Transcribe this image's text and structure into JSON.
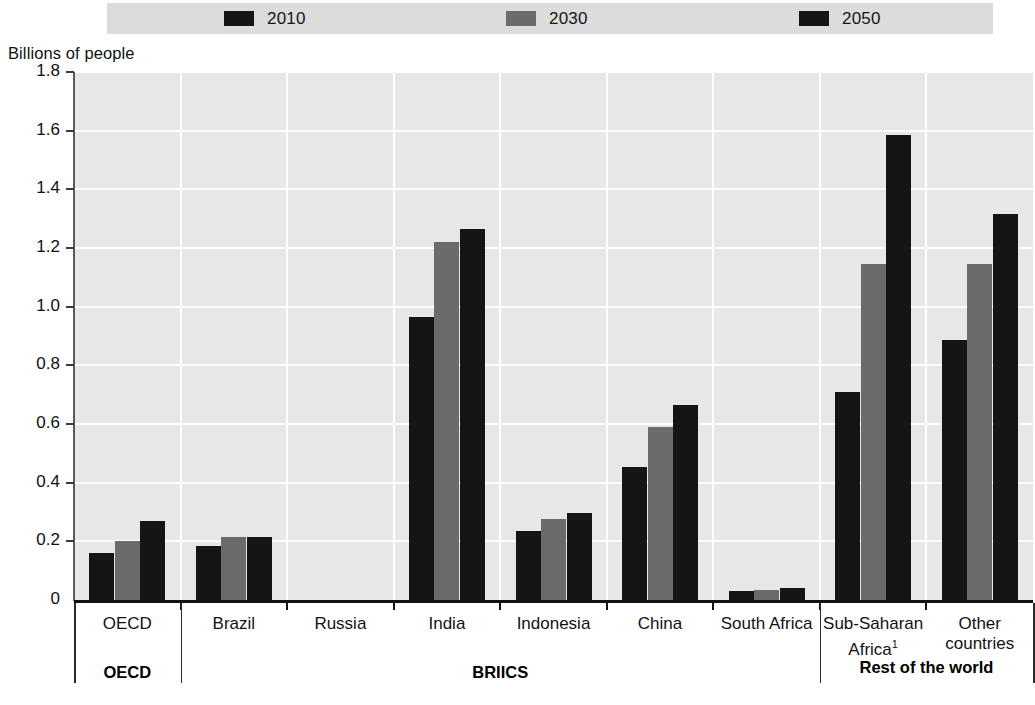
{
  "y_axis_title": "Billions of people",
  "legend": {
    "items": [
      {
        "label": "2010",
        "color": "#151515"
      },
      {
        "label": "2030",
        "color": "#6b6b6b"
      },
      {
        "label": "2050",
        "color": "#151515"
      }
    ]
  },
  "footnote": "",
  "group_labels": [
    {
      "label": "OECD"
    },
    {
      "label": "BRIICS"
    },
    {
      "label": "Rest of the world"
    }
  ],
  "y_ticks": [
    "1.8",
    "1.6",
    "1.4",
    "1.2",
    "1.0",
    "0.8",
    "0.6",
    "0.4",
    "0.2",
    "0"
  ],
  "chart_data": {
    "type": "bar",
    "title": "",
    "xlabel": "",
    "ylabel": "Billions of people",
    "ylim": [
      0,
      1.8
    ],
    "ytick_step": 0.2,
    "grid": true,
    "legend_position": "top",
    "categories": [
      "OECD",
      "Brazil",
      "Russia",
      "India",
      "Indonesia",
      "China",
      "South Africa",
      "Sub-Saharan Africa¹",
      "Other countries"
    ],
    "category_groups": [
      {
        "name": "OECD",
        "categories": [
          "OECD"
        ]
      },
      {
        "name": "BRIICS",
        "categories": [
          "Brazil",
          "Russia",
          "India",
          "Indonesia",
          "China",
          "South Africa"
        ]
      },
      {
        "name": "Rest of the world",
        "categories": [
          "Sub-Saharan Africa¹",
          "Other countries"
        ]
      }
    ],
    "series": [
      {
        "name": "2010",
        "color": "#151515",
        "values": [
          0.16,
          0.185,
          0.0,
          0.965,
          0.235,
          0.455,
          0.03,
          0.71,
          0.885
        ]
      },
      {
        "name": "2030",
        "color": "#6b6b6b",
        "values": [
          0.2,
          0.215,
          0.0,
          1.22,
          0.275,
          0.59,
          0.035,
          1.145,
          1.145
        ]
      },
      {
        "name": "2050",
        "color": "#151515",
        "values": [
          0.27,
          0.215,
          0.0,
          1.265,
          0.295,
          0.665,
          0.04,
          1.585,
          1.315
        ]
      }
    ]
  }
}
